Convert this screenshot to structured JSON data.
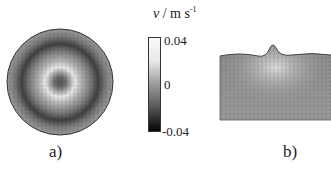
{
  "figure": {
    "colorbar": {
      "variable": "v",
      "unit_prefix": " / m s",
      "unit_exponent": "-1",
      "ticks": [
        "0.04",
        "0",
        "-0.04"
      ],
      "range": [
        -0.04,
        0.04
      ],
      "colormap": "grayscale (black = -0.04, white = 0.04)"
    },
    "panels": [
      {
        "label": "a)",
        "description": "Top view of circular domain showing velocity vector field with grayscale velocity magnitude; bright ring near centre, dark ring further out"
      },
      {
        "label": "b)",
        "description": "Side cross-section of domain showing velocity vectors with a surface bump near the centre"
      }
    ]
  }
}
